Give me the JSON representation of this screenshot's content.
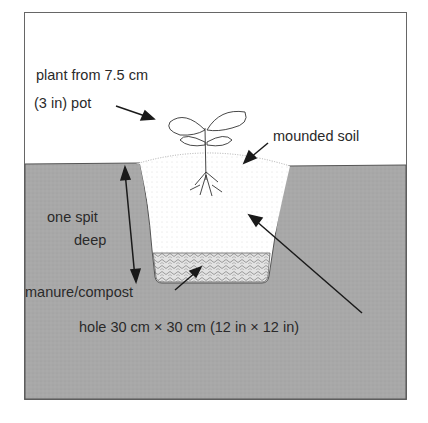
{
  "diagram": {
    "title_partial": "",
    "colors": {
      "background": "#ffffff",
      "soil": "#a8a8a8",
      "frame": "#555555",
      "compost": "#d8d8d8",
      "arrow": "#1a1a1a",
      "text": "#2a2a2a"
    },
    "labels": {
      "plant_line1": "plant from 7.5 cm",
      "plant_line2": "(3 in) pot",
      "mounded_soil": "mounded soil",
      "depth_line1": "one spit",
      "depth_line2": "deep",
      "compost": "manure/compost",
      "hole_size": "hole 30 cm × 30 cm (12 in × 12 in)"
    }
  }
}
